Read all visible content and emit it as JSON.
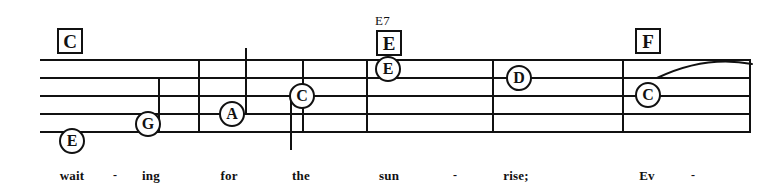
{
  "score": {
    "type": "music-staff-notation",
    "staff": {
      "left": 40,
      "right": 751,
      "line_ys": [
        59,
        77,
        95,
        113,
        131
      ],
      "line_count": 5
    },
    "barlines": [
      {
        "x": 158,
        "top": 77,
        "bottom": 131
      },
      {
        "x": 198,
        "top": 59,
        "bottom": 131
      },
      {
        "x": 302,
        "top": 59,
        "bottom": 131
      },
      {
        "x": 366,
        "top": 59,
        "bottom": 131
      },
      {
        "x": 492,
        "top": 59,
        "bottom": 131
      },
      {
        "x": 622,
        "top": 59,
        "bottom": 131
      },
      {
        "x": 749,
        "top": 59,
        "bottom": 131
      }
    ],
    "chords": [
      {
        "label": "C",
        "superscript": "",
        "x": 57,
        "y": 28
      },
      {
        "label": "E",
        "superscript": "E7",
        "x": 376,
        "y": 30
      },
      {
        "label": "F",
        "superscript": "",
        "x": 635,
        "y": 28
      }
    ],
    "notes": [
      {
        "name": "E",
        "cx": 72,
        "cy": 141,
        "stem": null
      },
      {
        "name": "G",
        "cx": 148,
        "cy": 124,
        "stem": null
      },
      {
        "name": "A",
        "cx": 232,
        "cy": 114,
        "stem": {
          "dir": "up",
          "x": 245,
          "from": 114,
          "to": 48
        }
      },
      {
        "name": "C",
        "cx": 302,
        "cy": 96,
        "stem": {
          "dir": "down",
          "x": 290,
          "from": 96,
          "to": 150
        }
      },
      {
        "name": "E",
        "cx": 388,
        "cy": 69,
        "stem": null
      },
      {
        "name": "D",
        "cx": 519,
        "cy": 78,
        "stem": null
      },
      {
        "name": "C",
        "cx": 648,
        "cy": 95,
        "stem": null
      }
    ],
    "slur": {
      "x1": 657,
      "y1": 78,
      "cx": 705,
      "cy": 55,
      "x2": 752,
      "y2": 64
    },
    "lyrics": [
      {
        "text": "wait",
        "x": 72,
        "kind": "word"
      },
      {
        "text": "-",
        "x": 115,
        "kind": "dash"
      },
      {
        "text": "ing",
        "x": 151,
        "kind": "word"
      },
      {
        "text": "for",
        "x": 229,
        "kind": "word"
      },
      {
        "text": "the",
        "x": 301,
        "kind": "word"
      },
      {
        "text": "sun",
        "x": 389,
        "kind": "word"
      },
      {
        "text": "-",
        "x": 455,
        "kind": "dash"
      },
      {
        "text": "rise;",
        "x": 516,
        "kind": "word"
      },
      {
        "text": "Ev",
        "x": 647,
        "kind": "word"
      },
      {
        "text": "-",
        "x": 693,
        "kind": "dash"
      }
    ],
    "lyrics_baseline_y": 168,
    "colors": {
      "ink": "#111111",
      "paper": "#ffffff"
    }
  }
}
